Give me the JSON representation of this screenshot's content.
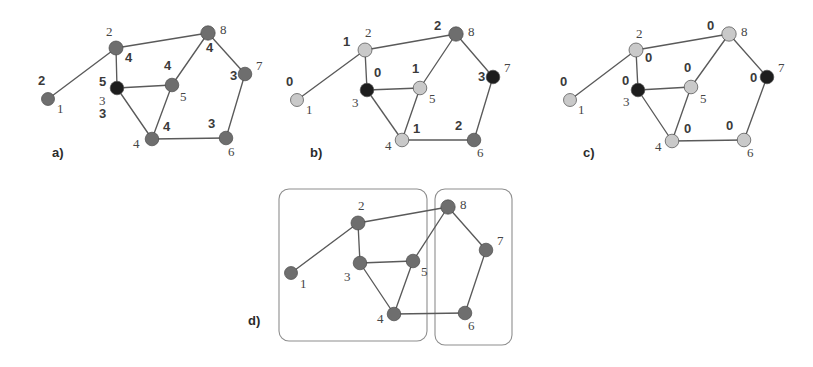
{
  "figure": {
    "width": 813,
    "height": 367,
    "background": "#ffffff"
  },
  "colors": {
    "node_gray": "#6e6e6e",
    "node_light": "#c9c9c9",
    "node_dark": "#1d1d1d",
    "node_mid": "#8a8a8a",
    "edge": "#5a5a5a",
    "box": "#8e8e8e",
    "text": "#3a3a3a"
  },
  "graph": {
    "nodes": [
      "1",
      "2",
      "3",
      "4",
      "5",
      "6",
      "7",
      "8"
    ],
    "edges": [
      [
        "1",
        "2"
      ],
      [
        "2",
        "3"
      ],
      [
        "2",
        "8"
      ],
      [
        "3",
        "5"
      ],
      [
        "3",
        "4"
      ],
      [
        "4",
        "5"
      ],
      [
        "4",
        "6"
      ],
      [
        "5",
        "8"
      ],
      [
        "6",
        "7"
      ],
      [
        "7",
        "8"
      ]
    ]
  },
  "panels": [
    {
      "id": "a",
      "caption": "a)",
      "caption_pos": [
        52,
        157
      ],
      "nodes": [
        {
          "id": "1",
          "x": 48,
          "y": 99,
          "r": 6.5,
          "color": "#6e6e6e",
          "index_pos": [
            57,
            113
          ],
          "weight": "2",
          "weight_pos": [
            38,
            85
          ]
        },
        {
          "id": "2",
          "x": 116,
          "y": 48,
          "r": 7.0,
          "color": "#6e6e6e",
          "index_pos": [
            106,
            36
          ],
          "weight": "4",
          "weight_pos": [
            125,
            62
          ]
        },
        {
          "id": "3",
          "x": 117,
          "y": 88,
          "r": 6.8,
          "color": "#1d1d1d",
          "index_pos": [
            99,
            105
          ],
          "weight": "5",
          "weight_pos": [
            99,
            86
          ]
        },
        {
          "id": "4",
          "x": 152,
          "y": 139,
          "r": 6.8,
          "color": "#6e6e6e",
          "index_pos": [
            133,
            148
          ],
          "weight": "4",
          "weight_pos": [
            163,
            131
          ]
        },
        {
          "id": "5",
          "x": 172,
          "y": 85,
          "r": 6.8,
          "color": "#6e6e6e",
          "index_pos": [
            180,
            101
          ],
          "weight": "4",
          "weight_pos": [
            164,
            70
          ]
        },
        {
          "id": "6",
          "x": 226,
          "y": 138,
          "r": 6.8,
          "color": "#6e6e6e",
          "index_pos": [
            228,
            156
          ],
          "weight": "3",
          "weight_pos": [
            208,
            128
          ]
        },
        {
          "id": "7",
          "x": 245,
          "y": 74,
          "r": 6.8,
          "color": "#6e6e6e",
          "index_pos": [
            256,
            70
          ],
          "weight": "3",
          "weight_pos": [
            230,
            80
          ]
        },
        {
          "id": "8",
          "x": 208,
          "y": 33,
          "r": 7.2,
          "color": "#6e6e6e",
          "index_pos": [
            220,
            34
          ],
          "weight": "4",
          "weight_pos": [
            206,
            52
          ]
        }
      ],
      "extra_label": {
        "text": "3",
        "pos": [
          99,
          104
        ]
      },
      "clusters": []
    },
    {
      "id": "b",
      "caption": "b)",
      "caption_pos": [
        310,
        157
      ],
      "nodes": [
        {
          "id": "1",
          "x": 297,
          "y": 100,
          "r": 6.5,
          "color": "#c9c9c9",
          "index_pos": [
            306,
            114
          ],
          "weight": "0",
          "weight_pos": [
            286,
            86
          ]
        },
        {
          "id": "2",
          "x": 365,
          "y": 50,
          "r": 7.0,
          "color": "#c9c9c9",
          "index_pos": [
            365,
            37
          ],
          "weight": "1",
          "weight_pos": [
            343,
            46
          ]
        },
        {
          "id": "3",
          "x": 367,
          "y": 90,
          "r": 6.8,
          "color": "#1d1d1d",
          "index_pos": [
            352,
            107
          ],
          "weight": "0",
          "weight_pos": [
            374,
            77
          ]
        },
        {
          "id": "4",
          "x": 402,
          "y": 140,
          "r": 6.8,
          "color": "#c9c9c9",
          "index_pos": [
            385,
            150
          ],
          "weight": "1",
          "weight_pos": [
            413,
            133
          ]
        },
        {
          "id": "5",
          "x": 420,
          "y": 88,
          "r": 6.8,
          "color": "#c9c9c9",
          "index_pos": [
            429,
            103
          ],
          "weight": "1",
          "weight_pos": [
            412,
            73
          ]
        },
        {
          "id": "6",
          "x": 474,
          "y": 140,
          "r": 6.8,
          "color": "#6e6e6e",
          "index_pos": [
            477,
            157
          ],
          "weight": "2",
          "weight_pos": [
            455,
            130
          ]
        },
        {
          "id": "7",
          "x": 493,
          "y": 77,
          "r": 6.8,
          "color": "#1d1d1d",
          "index_pos": [
            504,
            72
          ],
          "weight": "3",
          "weight_pos": [
            478,
            81
          ]
        },
        {
          "id": "8",
          "x": 456,
          "y": 34,
          "r": 7.2,
          "color": "#6e6e6e",
          "index_pos": [
            468,
            36
          ],
          "weight": "2",
          "weight_pos": [
            434,
            30
          ]
        }
      ],
      "clusters": []
    },
    {
      "id": "c",
      "caption": "c)",
      "caption_pos": [
        583,
        157
      ],
      "nodes": [
        {
          "id": "1",
          "x": 570,
          "y": 100,
          "r": 6.5,
          "color": "#c9c9c9",
          "index_pos": [
            578,
            114
          ],
          "weight": "0",
          "weight_pos": [
            560,
            86
          ]
        },
        {
          "id": "2",
          "x": 636,
          "y": 50,
          "r": 7.0,
          "color": "#c9c9c9",
          "index_pos": [
            636,
            38
          ],
          "weight": "0",
          "weight_pos": [
            645,
            62
          ]
        },
        {
          "id": "3",
          "x": 638,
          "y": 90,
          "r": 6.8,
          "color": "#1d1d1d",
          "index_pos": [
            623,
            106
          ],
          "weight": "0",
          "weight_pos": [
            622,
            85
          ]
        },
        {
          "id": "4",
          "x": 672,
          "y": 141,
          "r": 6.8,
          "color": "#c9c9c9",
          "index_pos": [
            655,
            151
          ],
          "weight": "0",
          "weight_pos": [
            684,
            133
          ]
        },
        {
          "id": "5",
          "x": 691,
          "y": 87,
          "r": 6.8,
          "color": "#c9c9c9",
          "index_pos": [
            700,
            103
          ],
          "weight": "0",
          "weight_pos": [
            684,
            72
          ]
        },
        {
          "id": "6",
          "x": 744,
          "y": 140,
          "r": 6.8,
          "color": "#c9c9c9",
          "index_pos": [
            747,
            157
          ],
          "weight": "0",
          "weight_pos": [
            726,
            130
          ]
        },
        {
          "id": "7",
          "x": 767,
          "y": 77,
          "r": 6.8,
          "color": "#1d1d1d",
          "index_pos": [
            778,
            72
          ],
          "weight": "0",
          "weight_pos": [
            750,
            82
          ]
        },
        {
          "id": "8",
          "x": 729,
          "y": 34,
          "r": 7.2,
          "color": "#c9c9c9",
          "index_pos": [
            741,
            36
          ],
          "weight": "0",
          "weight_pos": [
            707,
            30
          ]
        }
      ],
      "clusters": []
    },
    {
      "id": "d",
      "caption": "d)",
      "caption_pos": [
        248,
        325
      ],
      "nodes": [
        {
          "id": "1",
          "x": 291,
          "y": 273,
          "r": 6.5,
          "color": "#6e6e6e",
          "index_pos": [
            300,
            288
          ],
          "weight": "",
          "weight_pos": [
            0,
            0
          ]
        },
        {
          "id": "2",
          "x": 358,
          "y": 223,
          "r": 7.0,
          "color": "#6e6e6e",
          "index_pos": [
            358,
            210
          ],
          "weight": "",
          "weight_pos": [
            0,
            0
          ]
        },
        {
          "id": "3",
          "x": 360,
          "y": 263,
          "r": 6.8,
          "color": "#6e6e6e",
          "index_pos": [
            344,
            281
          ],
          "weight": "",
          "weight_pos": [
            0,
            0
          ]
        },
        {
          "id": "4",
          "x": 394,
          "y": 314,
          "r": 6.8,
          "color": "#6e6e6e",
          "index_pos": [
            377,
            323
          ],
          "weight": "",
          "weight_pos": [
            0,
            0
          ]
        },
        {
          "id": "5",
          "x": 413,
          "y": 261,
          "r": 6.8,
          "color": "#6e6e6e",
          "index_pos": [
            421,
            276
          ],
          "weight": "",
          "weight_pos": [
            0,
            0
          ]
        },
        {
          "id": "6",
          "x": 465,
          "y": 313,
          "r": 6.8,
          "color": "#6e6e6e",
          "index_pos": [
            468,
            330
          ],
          "weight": "",
          "weight_pos": [
            0,
            0
          ]
        },
        {
          "id": "7",
          "x": 486,
          "y": 250,
          "r": 6.8,
          "color": "#6e6e6e",
          "index_pos": [
            497,
            245
          ],
          "weight": "",
          "weight_pos": [
            0,
            0
          ]
        },
        {
          "id": "8",
          "x": 448,
          "y": 207,
          "r": 7.2,
          "color": "#6e6e6e",
          "index_pos": [
            460,
            209
          ],
          "weight": "",
          "weight_pos": [
            0,
            0
          ]
        }
      ],
      "clusters": [
        {
          "name": "cluster-left",
          "x": 279,
          "y": 189,
          "w": 148,
          "h": 152,
          "rx": 10
        },
        {
          "name": "cluster-right",
          "x": 435,
          "y": 189,
          "w": 77,
          "h": 156,
          "rx": 10
        }
      ]
    }
  ]
}
